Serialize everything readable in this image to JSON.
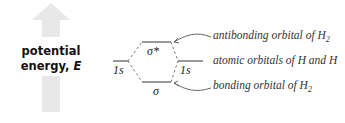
{
  "axis": {
    "label_line1": "potential",
    "label_line2": "energy,",
    "label_symbol": "E",
    "arrow_color": "#e6e6e6"
  },
  "levels": {
    "antibonding": "σ*",
    "left_atomic": "1s",
    "right_atomic": "1s",
    "bonding": "σ"
  },
  "annotations": {
    "antibonding": "antibonding orbital of H",
    "antibonding_sub": "2",
    "atomic": "atomic orbitals of H and H",
    "bonding": "bonding orbital of H",
    "bonding_sub": "2"
  }
}
